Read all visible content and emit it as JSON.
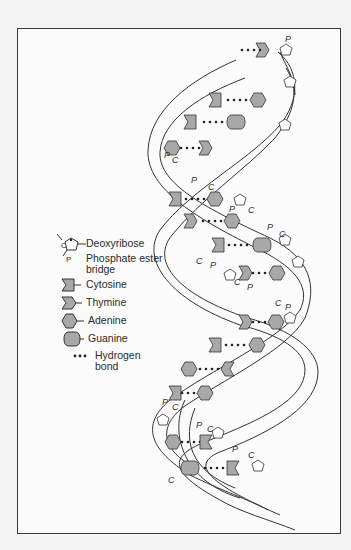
{
  "figure": {
    "colors": {
      "background": "#f4f4f4",
      "panel": "#fbfbfb",
      "frame": "#3a3a3a",
      "line": "#333333",
      "base_fill": "#a8a8a8",
      "label": "#2a2a2a"
    },
    "strand_labels": {
      "carbon": "C",
      "phosphate": "P"
    }
  },
  "legend": {
    "items": [
      {
        "id": "deoxyribose",
        "icon": "pentagon-sugar-icon",
        "label": "Deoxyribose",
        "sub_labels": [
          "C",
          "P"
        ]
      },
      {
        "id": "phosphate",
        "icon": "none",
        "label": "Phosphate ester bridge",
        "line1": "Phosphate ester",
        "line2": "bridge"
      },
      {
        "id": "cytosine",
        "icon": "cytosine-notch-icon",
        "label": "Cytosine"
      },
      {
        "id": "thymine",
        "icon": "thymine-notch-icon",
        "label": "Thymine"
      },
      {
        "id": "adenine",
        "icon": "hexagon-icon",
        "label": "Adenine"
      },
      {
        "id": "guanine",
        "icon": "rounded-hexagon-icon",
        "label": "Guanine"
      },
      {
        "id": "hydrogen",
        "icon": "dots-icon",
        "label": "Hydrogen bond",
        "line1": "Hydrogen",
        "line2": "bond"
      }
    ]
  }
}
